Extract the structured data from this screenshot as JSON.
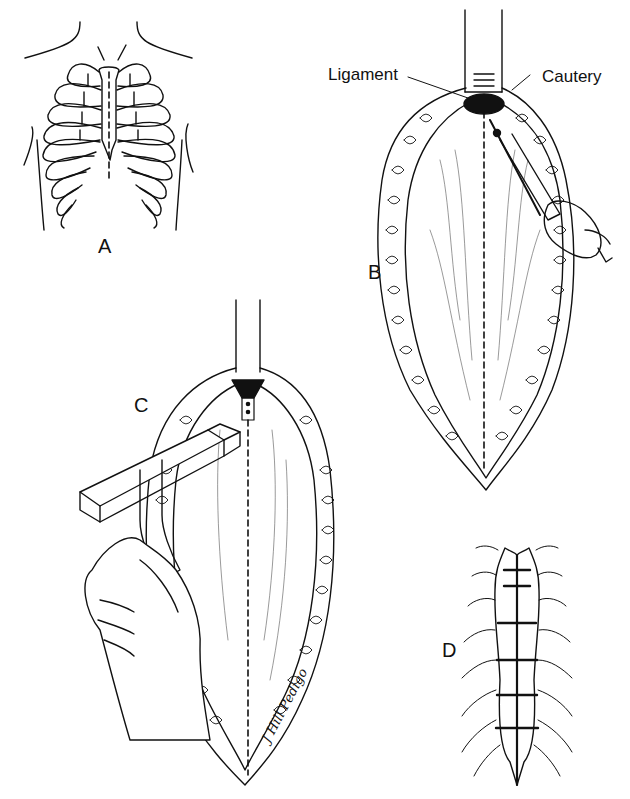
{
  "figure": {
    "panels": [
      {
        "id": "A",
        "label": "A",
        "description": "Anterior view of rib cage with dashed midline sternotomy incision line"
      },
      {
        "id": "B",
        "label": "B",
        "description": "Opened incision with retractor; cautery dividing ligament at sternal notch"
      },
      {
        "id": "C",
        "label": "C",
        "description": "Sternal saw held in hand dividing sternum along dashed midline"
      },
      {
        "id": "D",
        "label": "D",
        "description": "Sternum closed with wire sutures"
      }
    ],
    "callouts": {
      "ligament": "Ligament",
      "cautery": "Cautery"
    },
    "signature": "J Hill Pedigo",
    "colors": {
      "ink": "#111111",
      "background": "#ffffff"
    }
  }
}
